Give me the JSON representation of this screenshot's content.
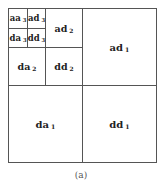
{
  "diagram": {
    "caption": "(a)",
    "subbands": [
      {
        "id": "aa3",
        "base": "aa",
        "level": "3"
      },
      {
        "id": "ad3",
        "base": "ad",
        "level": "3"
      },
      {
        "id": "da3",
        "base": "da",
        "level": "3"
      },
      {
        "id": "dd3",
        "base": "dd",
        "level": "3"
      },
      {
        "id": "ad2",
        "base": "ad",
        "level": "2"
      },
      {
        "id": "da2",
        "base": "da",
        "level": "2"
      },
      {
        "id": "dd2",
        "base": "dd",
        "level": "2"
      },
      {
        "id": "ad1",
        "base": "ad",
        "level": "1"
      },
      {
        "id": "da1",
        "base": "da",
        "level": "1"
      },
      {
        "id": "dd1",
        "base": "dd",
        "level": "1"
      }
    ]
  }
}
